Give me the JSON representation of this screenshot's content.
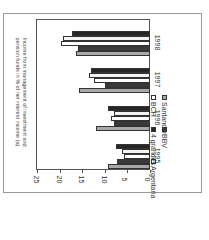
{
  "chart_data": {
    "type": "bar",
    "orientation": "rotated 90° (image rotated counterclockwise); value axis runs horizontally, categories vertically",
    "title": "Income from management of investment and pension funds in % of net interest income (a)",
    "xlabel": "",
    "ylabel": "",
    "categories": [
      "1995",
      "1996",
      "1997",
      "1998"
    ],
    "series": [
      {
        "name": "Santander",
        "color": "#a8a8a8",
        "values": [
          9.2,
          12.0,
          15.6,
          16.3
        ]
      },
      {
        "name": "BBV",
        "color": "#3a3a3a",
        "values": [
          7.4,
          7.9,
          10.0,
          15.9
        ]
      },
      {
        "name": "BCH",
        "color": "#ffffff",
        "values": [
          5.8,
          8.7,
          12.3,
          19.6
        ]
      },
      {
        "name": "Argentaria",
        "color": "#f4f4f4",
        "values": [
          6.3,
          7.9,
          13.5,
          19.3
        ]
      },
      {
        "name": "4 grandes",
        "color": "#262626",
        "values": [
          7.6,
          9.2,
          13.0,
          17.2
        ]
      }
    ],
    "yticks": [
      "0",
      "5",
      "10",
      "15",
      "20",
      "25"
    ],
    "ylim": [
      0,
      25
    ],
    "grid": false,
    "legend_position": "below"
  }
}
